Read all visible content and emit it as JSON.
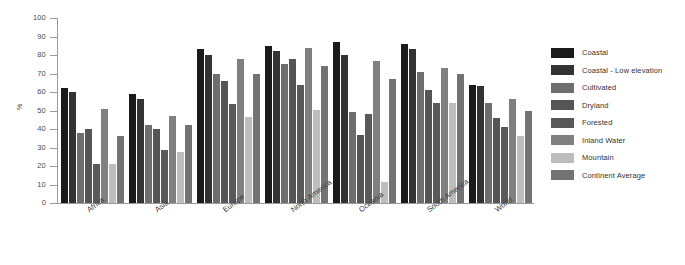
{
  "chart_data": {
    "type": "bar",
    "title": "",
    "subtitle": "",
    "xlabel": "",
    "ylabel": "%",
    "ylim": [
      0,
      100
    ],
    "ytick_labels": [
      "100",
      "90",
      "80",
      "70",
      "60",
      "50",
      "40",
      "30",
      "20",
      "10",
      "0"
    ],
    "ytick_values": [
      100,
      90,
      80,
      70,
      60,
      50,
      40,
      30,
      20,
      10,
      0
    ],
    "grid": false,
    "legend_position": "right",
    "categories": [
      "Africa",
      "Asia",
      "Europe",
      "North America",
      "Oceania",
      "South America",
      "World"
    ],
    "series": [
      {
        "name": "Coastal",
        "color": "#1a1a1a",
        "values": [
          62,
          59,
          83,
          85,
          87,
          86,
          64
        ]
      },
      {
        "name": "Coastal - Low elevation",
        "color": "#333333",
        "values": [
          60,
          56,
          80,
          82,
          80,
          83,
          63
        ]
      },
      {
        "name": "Cultivated",
        "color": "#6e6e6e",
        "values": [
          38,
          42,
          70,
          75,
          49,
          71,
          54
        ]
      },
      {
        "name": "Dryland",
        "color": "#555555",
        "values": [
          40,
          40,
          66,
          78,
          37,
          61,
          46
        ]
      },
      {
        "name": "Forested",
        "color": "#595959",
        "values": [
          21,
          28.5,
          53.5,
          64,
          48,
          54,
          41
        ]
      },
      {
        "name": "Inland Water",
        "color": "#808080",
        "values": [
          51,
          47,
          78,
          84,
          77,
          73,
          56
        ]
      },
      {
        "name": "Mountain",
        "color": "#bdbdbd",
        "values": [
          21,
          27.5,
          46.5,
          50.5,
          11.5,
          54,
          36
        ]
      },
      {
        "name": "Continent Average",
        "color": "#737373",
        "values": [
          36,
          42,
          69.5,
          74,
          67,
          70,
          50
        ]
      }
    ]
  }
}
